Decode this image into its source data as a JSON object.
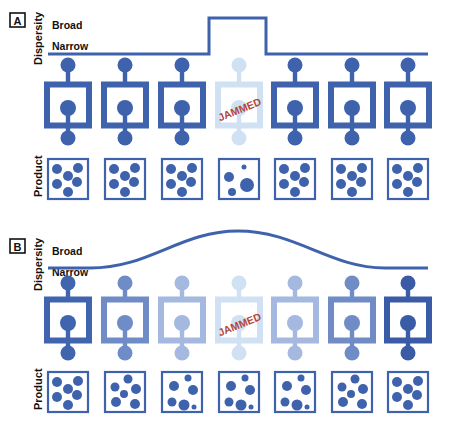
{
  "colors": {
    "primary": "#3f62ad",
    "line": "#3f62ad",
    "jammed_text": "#b3473a",
    "text": "#111111"
  },
  "panels": [
    {
      "id": "A",
      "label": "A",
      "y_axis_label": "Dispersity",
      "level_high_label": "Broad",
      "level_low_label": "Narrow",
      "product_label": "Product",
      "dispersity_curve": "step",
      "machines": [
        {
          "color": "#3f62ad",
          "jammed": false
        },
        {
          "color": "#3f62ad",
          "jammed": false
        },
        {
          "color": "#3f62ad",
          "jammed": false
        },
        {
          "color": "#cfe1f3",
          "jammed": true,
          "status_text": "JAMMED"
        },
        {
          "color": "#3f62ad",
          "jammed": false
        },
        {
          "color": "#3f62ad",
          "jammed": false
        },
        {
          "color": "#3f62ad",
          "jammed": false
        }
      ],
      "products": [
        "uniform",
        "uniform",
        "uniform",
        "disperse",
        "uniform",
        "uniform",
        "uniform"
      ]
    },
    {
      "id": "B",
      "label": "B",
      "y_axis_label": "Dispersity",
      "level_high_label": "Broad",
      "level_low_label": "Narrow",
      "product_label": "Product",
      "dispersity_curve": "bell",
      "machines": [
        {
          "color": "#4064ad",
          "jammed": false
        },
        {
          "color": "#6f8cc6",
          "jammed": false
        },
        {
          "color": "#a4b8e0",
          "jammed": false
        },
        {
          "color": "#cfe1f3",
          "jammed": true,
          "status_text": "JAMMED"
        },
        {
          "color": "#a4b8e0",
          "jammed": false
        },
        {
          "color": "#6f8cc6",
          "jammed": false
        },
        {
          "color": "#3a5ba5",
          "jammed": false
        }
      ],
      "products": [
        "uniform",
        "slightly-disperse",
        "disperse",
        "disperse",
        "disperse",
        "slightly-disperse",
        "uniform"
      ]
    }
  ]
}
